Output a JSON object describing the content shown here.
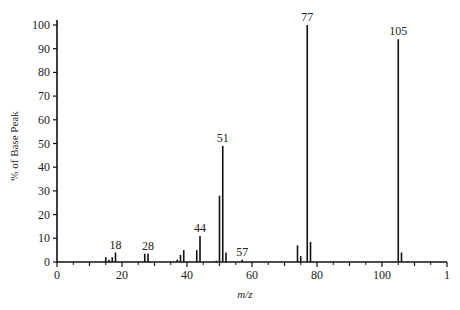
{
  "chart_data": {
    "type": "bar",
    "subtype": "mass-spectrum-stick",
    "title": "",
    "xlabel": "m/z",
    "ylabel": "% of Base Peak",
    "xlim": [
      0,
      120
    ],
    "ylim": [
      0,
      100
    ],
    "x_ticks": [
      0,
      20,
      40,
      60,
      80,
      100,
      120
    ],
    "x_tick_labels": [
      "0",
      "20",
      "40",
      "60",
      "80",
      "100",
      "1"
    ],
    "y_ticks": [
      0,
      10,
      20,
      30,
      40,
      50,
      60,
      70,
      80,
      90,
      100
    ],
    "grid": false,
    "legend": null,
    "peaks": [
      {
        "mz": 15,
        "intensity": 2
      },
      {
        "mz": 16,
        "intensity": 1
      },
      {
        "mz": 17,
        "intensity": 2
      },
      {
        "mz": 18,
        "intensity": 4,
        "label": "18"
      },
      {
        "mz": 27,
        "intensity": 3.5
      },
      {
        "mz": 28,
        "intensity": 3.5,
        "label": "28"
      },
      {
        "mz": 37,
        "intensity": 1
      },
      {
        "mz": 38,
        "intensity": 3
      },
      {
        "mz": 39,
        "intensity": 5
      },
      {
        "mz": 43,
        "intensity": 5
      },
      {
        "mz": 44,
        "intensity": 11,
        "label": "44"
      },
      {
        "mz": 49,
        "intensity": 0.5
      },
      {
        "mz": 50,
        "intensity": 28
      },
      {
        "mz": 51,
        "intensity": 49,
        "label": "51"
      },
      {
        "mz": 52,
        "intensity": 4
      },
      {
        "mz": 57,
        "intensity": 1,
        "label": "57"
      },
      {
        "mz": 74,
        "intensity": 7
      },
      {
        "mz": 75,
        "intensity": 2.5
      },
      {
        "mz": 77,
        "intensity": 100,
        "label": "77"
      },
      {
        "mz": 78,
        "intensity": 8.5
      },
      {
        "mz": 105,
        "intensity": 94,
        "label": "105"
      },
      {
        "mz": 106,
        "intensity": 4
      }
    ]
  }
}
